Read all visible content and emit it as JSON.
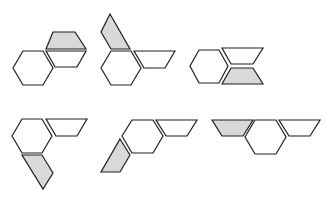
{
  "diagram": {
    "type": "shape-puzzle-options",
    "colors": {
      "stroke": "#1e1e1e",
      "white_fill": "#ffffff",
      "shaded_fill": "#d9d9d9",
      "background": "#ffffff"
    },
    "figures": [
      {
        "id": "fig-1",
        "shapes": [
          {
            "kind": "hexagon",
            "fill": "white",
            "points": "13,68 23,51 43,51 53,68 43,85 23,85"
          },
          {
            "kind": "trapezoid",
            "fill": "gray",
            "points": "53,32 75,32 86,49 46,49"
          },
          {
            "kind": "trapezoid",
            "fill": "white",
            "points": "46,51 86,51 77,67 55,67"
          }
        ]
      },
      {
        "id": "fig-2",
        "shapes": [
          {
            "kind": "hexagon",
            "fill": "white",
            "points": "101,68 111,51 131,51 141,68 131,85 111,85"
          },
          {
            "kind": "trapezoid",
            "fill": "gray",
            "points": "110,14 130,49 111,49 101,32"
          },
          {
            "kind": "trapezoid",
            "fill": "white",
            "points": "134,51 175,51 165,68 144,68"
          }
        ]
      },
      {
        "id": "fig-3",
        "shapes": [
          {
            "kind": "hexagon",
            "fill": "white",
            "points": "190,66 199,50 219,50 228,66 219,83 199,83"
          },
          {
            "kind": "trapezoid",
            "fill": "white",
            "points": "222,48 263,48 253,64 231,64"
          },
          {
            "kind": "trapezoid",
            "fill": "gray",
            "points": "231,68 253,68 263,84 222,84"
          }
        ]
      },
      {
        "id": "fig-4",
        "shapes": [
          {
            "kind": "hexagon",
            "fill": "white",
            "points": "12,136 22,119 42,119 52,136 42,153 22,153"
          },
          {
            "kind": "trapezoid",
            "fill": "white",
            "points": "46,119 87,119 77,136 56,136"
          },
          {
            "kind": "trapezoid",
            "fill": "gray",
            "points": "22,155 42,155 53,173 43,189"
          }
        ]
      },
      {
        "id": "fig-5",
        "shapes": [
          {
            "kind": "hexagon",
            "fill": "white",
            "points": "122,136 132,120 153,120 163,136 153,153 132,153"
          },
          {
            "kind": "trapezoid",
            "fill": "white",
            "points": "156,120 197,120 187,136 166,136"
          },
          {
            "kind": "trapezoid",
            "fill": "gray",
            "points": "120,139 130,155 120,172 101,172"
          }
        ]
      },
      {
        "id": "fig-6",
        "shapes": [
          {
            "kind": "trapezoid",
            "fill": "gray",
            "points": "212,120 253,120 243,136 222,136"
          },
          {
            "kind": "hexagon",
            "fill": "white",
            "points": "245,137 255,120 276,120 286,137 276,154 255,154"
          },
          {
            "kind": "trapezoid",
            "fill": "white",
            "points": "279,120 320,120 310,136 289,136"
          }
        ]
      }
    ]
  }
}
